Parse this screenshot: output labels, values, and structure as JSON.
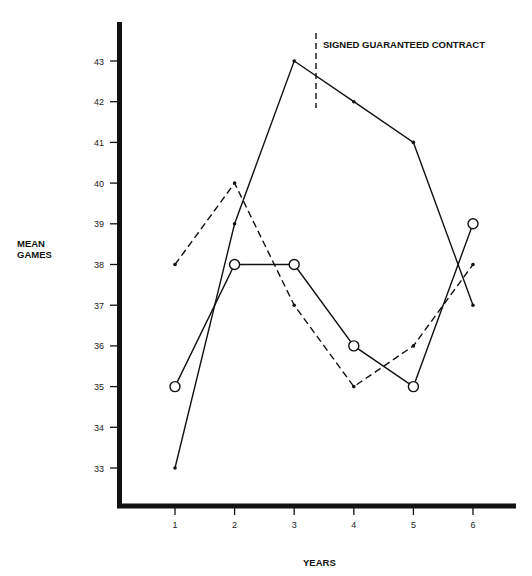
{
  "chart_data": {
    "type": "line",
    "title": "",
    "xlabel": "YEARS",
    "ylabel": "MEAN GAMES",
    "x": [
      1,
      2,
      3,
      4,
      5,
      6
    ],
    "x_tick_labels": [
      "1",
      "2",
      "3",
      "4",
      "5",
      "6"
    ],
    "y_tick_labels": [
      "33",
      "34",
      "35",
      "36",
      "37",
      "38",
      "39",
      "40",
      "41",
      "42",
      "43"
    ],
    "ylim": [
      32,
      44
    ],
    "grid": false,
    "legend": null,
    "series": [
      {
        "name": "solid line with dot markers",
        "style": "solid",
        "marker": "dot",
        "values": [
          33,
          39,
          43,
          42,
          41,
          37
        ]
      },
      {
        "name": "dashed line with dot markers",
        "style": "dashed",
        "marker": "dot",
        "values": [
          38,
          40,
          37,
          35,
          36,
          38
        ]
      },
      {
        "name": "solid line with open circle markers",
        "style": "solid",
        "marker": "circle",
        "values": [
          35,
          38,
          38,
          36,
          35,
          39
        ]
      }
    ],
    "annotations": [
      {
        "text": "SIGNED GUARANTEED CONTRACT",
        "type": "vertical-dashed-line",
        "x": 3.37
      }
    ]
  },
  "labels": {
    "ylabel_line1": "MEAN",
    "ylabel_line2": "GAMES",
    "xlabel": "YEARS",
    "annotation": "SIGNED GUARANTEED CONTRACT"
  },
  "colors": {
    "ink": "#111111",
    "background": "#ffffff"
  }
}
